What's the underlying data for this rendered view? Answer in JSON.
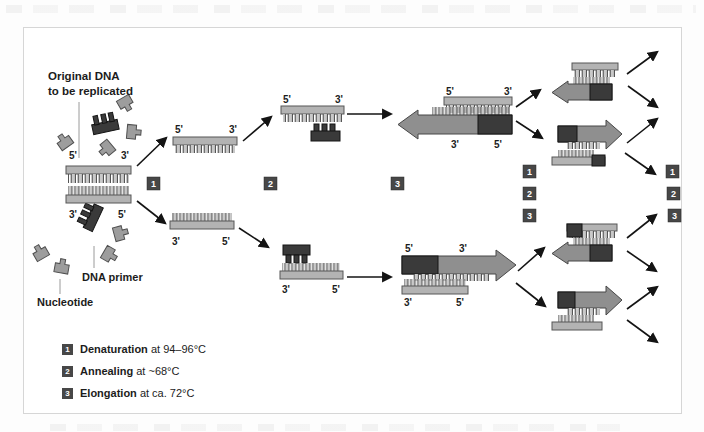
{
  "annotation": {
    "line1": "Original DNA",
    "line2": "to be replicated"
  },
  "labels": {
    "five_prime": "5'",
    "three_prime": "3'",
    "dna_primer": "DNA primer",
    "nucleotide": "Nucleotide"
  },
  "steps": {
    "one": "1",
    "two": "2",
    "three": "3"
  },
  "legend": [
    {
      "num": "1",
      "term": "Denaturation",
      "rest": " at 94–96°C"
    },
    {
      "num": "2",
      "term": "Annealing",
      "rest": " at ~68°C"
    },
    {
      "num": "3",
      "term": "Elongation",
      "rest": " at ca. 72°C"
    }
  ],
  "colors": {
    "strand_light": "#b3b3b3",
    "strand_stroke": "#565656",
    "tooth_fill": "#c9c9c9",
    "tooth_stroke": "#454545",
    "arrow_fill": "#8f8f8f",
    "arrow_stroke": "#474747",
    "dark_fill": "#3a3a3a",
    "dark_stroke": "#141414",
    "box_fill": "#474747",
    "text": "#1c1c1c",
    "panel_border": "#d6d6d6"
  }
}
